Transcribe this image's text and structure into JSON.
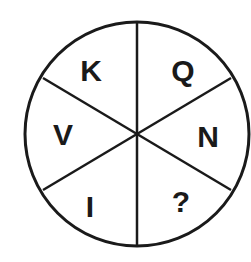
{
  "puzzle": {
    "type": "letter-wheel",
    "segments": [
      {
        "position": "top-left",
        "label": "K"
      },
      {
        "position": "top-right",
        "label": "Q"
      },
      {
        "position": "right",
        "label": "N"
      },
      {
        "position": "bottom-right",
        "label": "?"
      },
      {
        "position": "bottom-left",
        "label": "I"
      },
      {
        "position": "left",
        "label": "V"
      }
    ],
    "colors": {
      "stroke": "#1a1a1a",
      "background": "#ffffff"
    }
  }
}
